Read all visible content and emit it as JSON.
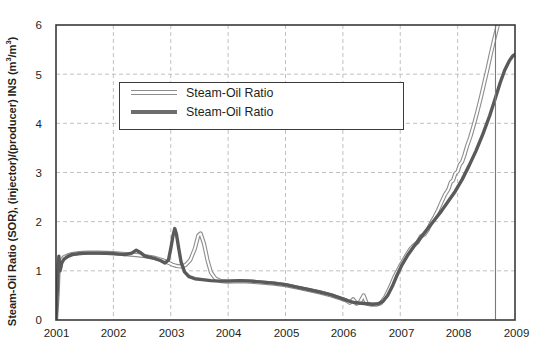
{
  "chart_data": {
    "type": "line",
    "title": "",
    "xlabel": "",
    "ylabel": "Steam-Oil Ratio (SOR), (injector)/(producer) INS (m3/m3)",
    "ylabel_parts": {
      "pre": "Steam-Oil Ratio (SOR), (injector)/(producer) INS (m",
      "sup1": "3",
      "mid": "/m",
      "sup2": "3",
      "post": ")"
    },
    "xlim": [
      2001,
      2009
    ],
    "ylim": [
      0,
      6
    ],
    "xticks": [
      "2001",
      "2002",
      "2003",
      "2004",
      "2005",
      "2006",
      "2007",
      "2008",
      "2009"
    ],
    "yticks": [
      "0",
      "1",
      "2",
      "3",
      "4",
      "5",
      "6"
    ],
    "grid": "dashed-both",
    "legend_position": "upper-left-inside",
    "annotations": [
      {
        "name": "vertical-marker-line",
        "type": "vline",
        "x": 2008.66,
        "style": "solid-gray"
      }
    ],
    "series": [
      {
        "name": "Steam-Oil Ratio",
        "style": "hollow-light",
        "color": "#8d8d8d",
        "fill": "#ffffff",
        "points": [
          [
            2001.0,
            0.0
          ],
          [
            2001.03,
            0.55
          ],
          [
            2001.05,
            1.18
          ],
          [
            2001.07,
            1.05
          ],
          [
            2001.1,
            1.22
          ],
          [
            2001.14,
            1.28
          ],
          [
            2001.2,
            1.31
          ],
          [
            2001.28,
            1.34
          ],
          [
            2001.4,
            1.36
          ],
          [
            2001.55,
            1.37
          ],
          [
            2001.75,
            1.37
          ],
          [
            2002.0,
            1.36
          ],
          [
            2002.2,
            1.34
          ],
          [
            2002.4,
            1.32
          ],
          [
            2002.55,
            1.3
          ],
          [
            2002.7,
            1.27
          ],
          [
            2002.85,
            1.22
          ],
          [
            2002.95,
            1.17
          ],
          [
            2003.02,
            1.13
          ],
          [
            2003.1,
            1.1
          ],
          [
            2003.18,
            1.09
          ],
          [
            2003.26,
            1.12
          ],
          [
            2003.34,
            1.22
          ],
          [
            2003.42,
            1.45
          ],
          [
            2003.48,
            1.72
          ],
          [
            2003.52,
            1.76
          ],
          [
            2003.58,
            1.55
          ],
          [
            2003.64,
            1.22
          ],
          [
            2003.7,
            0.97
          ],
          [
            2003.78,
            0.84
          ],
          [
            2003.88,
            0.79
          ],
          [
            2004.0,
            0.78
          ],
          [
            2004.2,
            0.79
          ],
          [
            2004.4,
            0.78
          ],
          [
            2004.6,
            0.76
          ],
          [
            2004.8,
            0.74
          ],
          [
            2005.0,
            0.71
          ],
          [
            2005.2,
            0.66
          ],
          [
            2005.4,
            0.61
          ],
          [
            2005.6,
            0.56
          ],
          [
            2005.8,
            0.5
          ],
          [
            2005.95,
            0.44
          ],
          [
            2006.05,
            0.4
          ],
          [
            2006.12,
            0.35
          ],
          [
            2006.18,
            0.42
          ],
          [
            2006.24,
            0.33
          ],
          [
            2006.3,
            0.37
          ],
          [
            2006.36,
            0.5
          ],
          [
            2006.42,
            0.33
          ],
          [
            2006.5,
            0.31
          ],
          [
            2006.58,
            0.31
          ],
          [
            2006.66,
            0.34
          ],
          [
            2006.74,
            0.47
          ],
          [
            2006.82,
            0.66
          ],
          [
            2006.9,
            0.88
          ],
          [
            2007.0,
            1.1
          ],
          [
            2007.1,
            1.3
          ],
          [
            2007.18,
            1.45
          ],
          [
            2007.24,
            1.52
          ],
          [
            2007.3,
            1.58
          ],
          [
            2007.36,
            1.7
          ],
          [
            2007.42,
            1.74
          ],
          [
            2007.48,
            1.84
          ],
          [
            2007.54,
            1.98
          ],
          [
            2007.6,
            2.1
          ],
          [
            2007.66,
            2.24
          ],
          [
            2007.72,
            2.4
          ],
          [
            2007.78,
            2.55
          ],
          [
            2007.84,
            2.66
          ],
          [
            2007.88,
            2.8
          ],
          [
            2007.92,
            2.84
          ],
          [
            2007.96,
            2.98
          ],
          [
            2008.0,
            3.02
          ],
          [
            2008.04,
            3.16
          ],
          [
            2008.08,
            3.22
          ],
          [
            2008.12,
            3.36
          ],
          [
            2008.16,
            3.52
          ],
          [
            2008.22,
            3.72
          ],
          [
            2008.28,
            3.96
          ],
          [
            2008.34,
            4.22
          ],
          [
            2008.4,
            4.5
          ],
          [
            2008.46,
            4.8
          ],
          [
            2008.52,
            5.1
          ],
          [
            2008.58,
            5.42
          ],
          [
            2008.64,
            5.72
          ],
          [
            2008.7,
            6.0
          ]
        ]
      },
      {
        "name": "Steam-Oil Ratio",
        "style": "solid-dark",
        "color": "#4d4d4d",
        "points": [
          [
            2001.0,
            0.0
          ],
          [
            2001.03,
            0.8
          ],
          [
            2001.05,
            1.3
          ],
          [
            2001.07,
            1.0
          ],
          [
            2001.1,
            1.16
          ],
          [
            2001.14,
            1.24
          ],
          [
            2001.2,
            1.29
          ],
          [
            2001.28,
            1.33
          ],
          [
            2001.4,
            1.35
          ],
          [
            2001.55,
            1.36
          ],
          [
            2001.75,
            1.36
          ],
          [
            2002.0,
            1.35
          ],
          [
            2002.2,
            1.33
          ],
          [
            2002.32,
            1.36
          ],
          [
            2002.4,
            1.42
          ],
          [
            2002.46,
            1.38
          ],
          [
            2002.55,
            1.3
          ],
          [
            2002.7,
            1.26
          ],
          [
            2002.82,
            1.21
          ],
          [
            2002.9,
            1.16
          ],
          [
            2002.96,
            1.22
          ],
          [
            2003.0,
            1.45
          ],
          [
            2003.04,
            1.72
          ],
          [
            2003.07,
            1.86
          ],
          [
            2003.1,
            1.74
          ],
          [
            2003.14,
            1.45
          ],
          [
            2003.18,
            1.18
          ],
          [
            2003.24,
            0.98
          ],
          [
            2003.32,
            0.88
          ],
          [
            2003.42,
            0.84
          ],
          [
            2003.55,
            0.82
          ],
          [
            2003.7,
            0.8
          ],
          [
            2003.85,
            0.79
          ],
          [
            2004.0,
            0.79
          ],
          [
            2004.2,
            0.8
          ],
          [
            2004.4,
            0.79
          ],
          [
            2004.6,
            0.77
          ],
          [
            2004.8,
            0.75
          ],
          [
            2005.0,
            0.72
          ],
          [
            2005.2,
            0.67
          ],
          [
            2005.4,
            0.62
          ],
          [
            2005.6,
            0.57
          ],
          [
            2005.8,
            0.51
          ],
          [
            2006.0,
            0.43
          ],
          [
            2006.12,
            0.38
          ],
          [
            2006.22,
            0.35
          ],
          [
            2006.32,
            0.34
          ],
          [
            2006.42,
            0.33
          ],
          [
            2006.52,
            0.32
          ],
          [
            2006.62,
            0.33
          ],
          [
            2006.7,
            0.38
          ],
          [
            2006.78,
            0.5
          ],
          [
            2006.86,
            0.68
          ],
          [
            2006.94,
            0.9
          ],
          [
            2007.02,
            1.1
          ],
          [
            2007.12,
            1.3
          ],
          [
            2007.24,
            1.5
          ],
          [
            2007.36,
            1.68
          ],
          [
            2007.48,
            1.86
          ],
          [
            2007.6,
            2.04
          ],
          [
            2007.72,
            2.22
          ],
          [
            2007.84,
            2.42
          ],
          [
            2007.96,
            2.62
          ],
          [
            2008.08,
            2.86
          ],
          [
            2008.2,
            3.14
          ],
          [
            2008.32,
            3.44
          ],
          [
            2008.44,
            3.78
          ],
          [
            2008.56,
            4.16
          ],
          [
            2008.66,
            4.52
          ],
          [
            2008.74,
            4.82
          ],
          [
            2008.82,
            5.08
          ],
          [
            2008.9,
            5.27
          ],
          [
            2008.96,
            5.37
          ],
          [
            2009.0,
            5.4
          ]
        ]
      }
    ],
    "legend_entries": [
      {
        "label": "Steam-Oil Ratio",
        "style": "hollow-light"
      },
      {
        "label": "Steam-Oil Ratio",
        "style": "solid-dark"
      }
    ]
  },
  "colors": {
    "frame": "#3a3a3a",
    "grid": "#b9b9b9",
    "light_line": "#8d8d8d",
    "dark_line": "#5a5a5a",
    "marker_line": "#7a7a7a",
    "text": "#231f20",
    "background": "#ffffff"
  }
}
